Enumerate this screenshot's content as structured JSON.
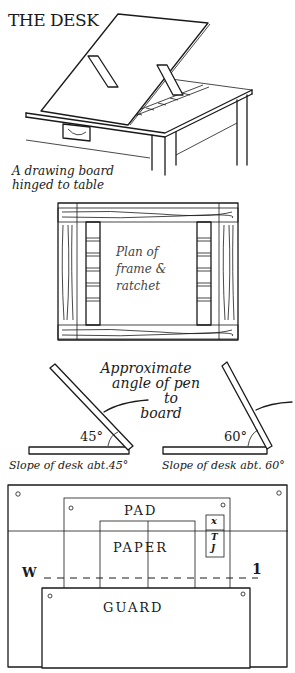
{
  "title": "THE DESK",
  "desk_caption": [
    "A drawing board",
    "hinged to table"
  ],
  "plan": {
    "label": [
      "Plan of",
      "frame &",
      "ratchet"
    ]
  },
  "angles": {
    "note": [
      "Approximate",
      "angle of pen",
      "to",
      "board"
    ],
    "left_angle": "45°",
    "right_angle": "60°",
    "left_caption": "Slope of desk abt.45°",
    "right_caption": "Slope of desk abt. 60°"
  },
  "layout_diagram": {
    "pad": "PAD",
    "paper": "PAPER",
    "guard": "GUARD",
    "left_marker": "W",
    "right_marker": "1",
    "side_box": [
      "x",
      "T",
      "J"
    ]
  }
}
